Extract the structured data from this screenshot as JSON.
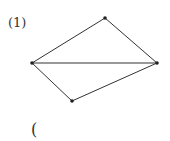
{
  "problem_label": "(1)",
  "answer_bracket": "(",
  "diagram": {
    "type": "quadrilateral-with-diagonal",
    "vertices": [
      {
        "name": "top",
        "x": 105,
        "y": 18
      },
      {
        "name": "left",
        "x": 32,
        "y": 63
      },
      {
        "name": "right",
        "x": 157,
        "y": 63
      },
      {
        "name": "bottom",
        "x": 72,
        "y": 101
      }
    ],
    "edges": [
      [
        "left",
        "top"
      ],
      [
        "top",
        "right"
      ],
      [
        "right",
        "bottom"
      ],
      [
        "bottom",
        "left"
      ],
      [
        "left",
        "right"
      ]
    ],
    "line_color": "#333333"
  }
}
